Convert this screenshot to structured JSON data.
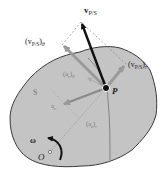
{
  "figure": {
    "body_label": "S",
    "point_label": "P",
    "origin_label": "O",
    "omega_label": "ω",
    "vectors": {
      "v_ps": {
        "main": "v",
        "sub": "P/S"
      },
      "v_ps_theta": {
        "open": "(v",
        "sub": "P/S",
        "close": ")",
        "comp": "θ"
      },
      "v_ps_r": {
        "open": "(v",
        "sub": "P/S",
        "close": ")",
        "comp": "r"
      },
      "ac_theta": {
        "open": "(a",
        "sub": "c",
        "close": ")",
        "comp": "θ"
      },
      "ac": {
        "main": "a",
        "sub": "c"
      },
      "ac_r": {
        "open": "(a",
        "sub": "c",
        "close": ")",
        "comp": "r"
      }
    },
    "colors": {
      "body_fill": "#c4c4c4",
      "body_outline": "#3a3a3a",
      "main_vector": "#111111",
      "component_vector": "#9a9a9a",
      "dashed_line": "#888888",
      "text": "#222222"
    }
  }
}
